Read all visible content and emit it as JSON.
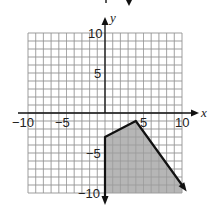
{
  "chart_data": {
    "type": "area",
    "title": "",
    "xlabel": "x",
    "ylabel": "y",
    "xlim": [
      -10,
      10
    ],
    "ylim": [
      -10,
      10
    ],
    "grid": true,
    "grid_step": 1,
    "x_tick_labels": [
      "-10",
      "-5",
      "5",
      "10"
    ],
    "y_tick_labels": [
      "10",
      "5",
      "-5",
      "-10"
    ],
    "boundary_points": [
      [
        0,
        -10
      ],
      [
        0,
        -3
      ],
      [
        4,
        -1
      ],
      [
        10,
        -9
      ]
    ],
    "shaded_region": {
      "description": "Region below piecewise boundary for x >= 0",
      "vertices": [
        [
          0,
          -10
        ],
        [
          0,
          -3
        ],
        [
          4,
          -1
        ],
        [
          10,
          -9
        ],
        [
          10,
          -10
        ]
      ],
      "fill_color": "#a9a9a9"
    },
    "colors": {
      "boundary": "#111111",
      "grid": "#9a9a9a",
      "axes": "#111111"
    }
  },
  "labels": {
    "x_axis": "x",
    "y_axis": "y",
    "xt_m10": "−10",
    "xt_m5": "−5",
    "xt_5": "5",
    "xt_10": "10",
    "yt_10": "10",
    "yt_5": "5",
    "yt_m5": "−5",
    "yt_m10": "−10"
  }
}
